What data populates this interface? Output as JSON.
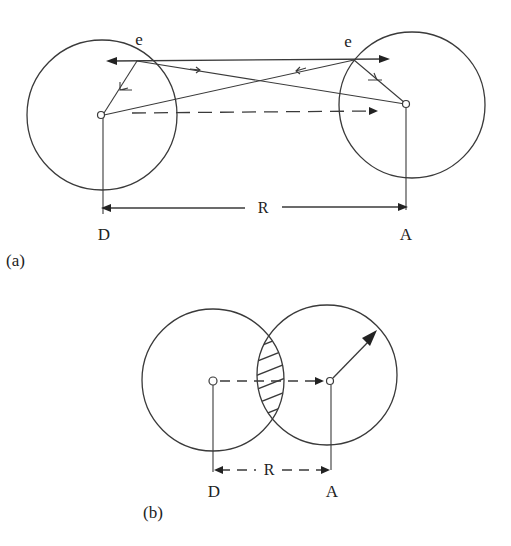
{
  "figure": {
    "panel_a": {
      "label": "(a)",
      "donor_label": "D",
      "acceptor_label": "A",
      "distance_label": "R",
      "electron_label_left": "e",
      "electron_label_right": "e"
    },
    "panel_b": {
      "label": "(b)",
      "donor_label": "D",
      "acceptor_label": "A",
      "distance_label": "R"
    },
    "colors": {
      "line": "#3a3a3a",
      "text": "#222222",
      "background": "#ffffff"
    }
  }
}
